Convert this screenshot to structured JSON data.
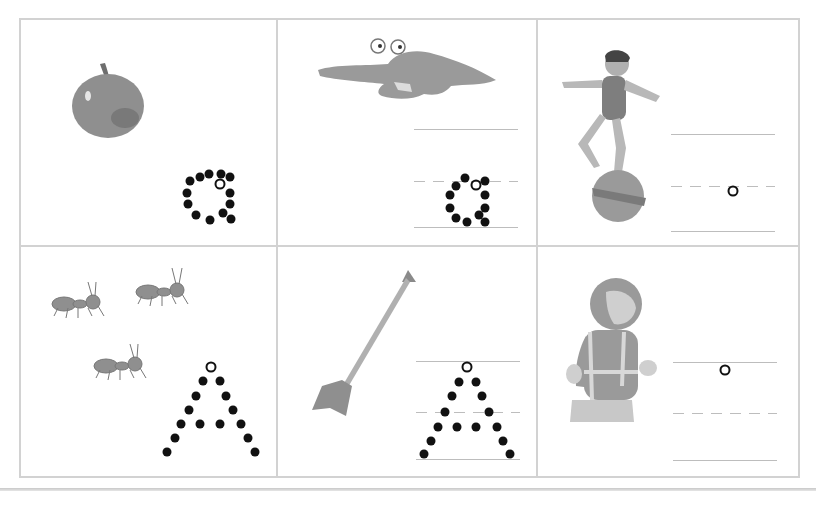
{
  "worksheet": {
    "letter_lower": "a",
    "letter_upper": "A",
    "colors": {
      "border": "#d2d2d2",
      "guide": "#bdbdbd",
      "dot": "#111111",
      "illustration": "#8f8f8f"
    },
    "cells": [
      {
        "id": "apple",
        "picture": "apple-icon",
        "guides": [],
        "dots": [
          [
            190,
            181
          ],
          [
            200,
            177
          ],
          [
            209,
            174
          ],
          [
            221,
            174
          ],
          [
            230,
            177
          ],
          [
            187,
            193
          ],
          [
            230,
            193
          ],
          [
            188,
            204
          ],
          [
            230,
            204
          ],
          [
            196,
            215
          ],
          [
            210,
            220
          ],
          [
            223,
            213
          ],
          [
            231,
            219
          ]
        ],
        "start": [
          220,
          184
        ]
      },
      {
        "id": "alligator",
        "picture": "alligator-icon",
        "guides": [
          {
            "type": "solid",
            "x": 414,
            "y": 129,
            "w": 104
          },
          {
            "type": "dashed",
            "x": 414,
            "y": 181,
            "w": 104
          },
          {
            "type": "solid",
            "x": 414,
            "y": 227,
            "w": 104
          }
        ],
        "dots": [
          [
            456,
            186
          ],
          [
            465,
            178
          ],
          [
            485,
            181
          ],
          [
            450,
            195
          ],
          [
            485,
            195
          ],
          [
            450,
            208
          ],
          [
            485,
            208
          ],
          [
            456,
            218
          ],
          [
            467,
            222
          ],
          [
            479,
            215
          ],
          [
            485,
            222
          ]
        ],
        "start": [
          476,
          185
        ]
      },
      {
        "id": "acrobat",
        "picture": "acrobat-icon",
        "guides": [
          {
            "type": "solid",
            "x": 671,
            "y": 134,
            "w": 104
          },
          {
            "type": "dashed",
            "x": 671,
            "y": 186,
            "w": 104
          },
          {
            "type": "solid",
            "x": 671,
            "y": 231,
            "w": 104
          }
        ],
        "dots": [],
        "start": [
          733,
          191
        ]
      },
      {
        "id": "ants",
        "picture": "ants-icon",
        "guides": [],
        "dots": [
          [
            203,
            381
          ],
          [
            220,
            381
          ],
          [
            196,
            396
          ],
          [
            226,
            396
          ],
          [
            189,
            410
          ],
          [
            233,
            410
          ],
          [
            181,
            424
          ],
          [
            200,
            424
          ],
          [
            220,
            424
          ],
          [
            241,
            424
          ],
          [
            175,
            438
          ],
          [
            248,
            438
          ],
          [
            167,
            452
          ],
          [
            255,
            452
          ]
        ],
        "start": [
          211,
          367
        ]
      },
      {
        "id": "arrow",
        "picture": "arrow-icon",
        "guides": [
          {
            "type": "solid",
            "x": 416,
            "y": 361,
            "w": 104
          },
          {
            "type": "dashed",
            "x": 416,
            "y": 412,
            "w": 104
          },
          {
            "type": "solid",
            "x": 416,
            "y": 459,
            "w": 104
          }
        ],
        "dots": [
          [
            459,
            382
          ],
          [
            476,
            382
          ],
          [
            452,
            396
          ],
          [
            482,
            396
          ],
          [
            445,
            412
          ],
          [
            489,
            412
          ],
          [
            438,
            427
          ],
          [
            457,
            427
          ],
          [
            476,
            427
          ],
          [
            497,
            427
          ],
          [
            431,
            441
          ],
          [
            503,
            441
          ],
          [
            424,
            454
          ],
          [
            510,
            454
          ]
        ],
        "start": [
          467,
          367
        ]
      },
      {
        "id": "astronaut",
        "picture": "astronaut-icon",
        "guides": [
          {
            "type": "solid",
            "x": 673,
            "y": 362,
            "w": 104
          },
          {
            "type": "dashed",
            "x": 673,
            "y": 413,
            "w": 104
          },
          {
            "type": "solid",
            "x": 673,
            "y": 460,
            "w": 104
          }
        ],
        "dots": [],
        "start": [
          725,
          370
        ]
      }
    ]
  }
}
